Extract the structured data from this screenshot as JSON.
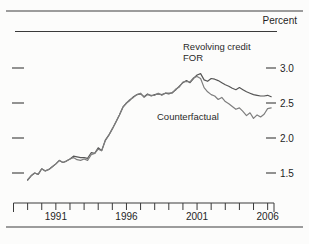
{
  "header": {
    "unit_label": "Percent"
  },
  "annotations": {
    "revolving_line1": "Revolving credit",
    "revolving_line2": "FOR",
    "counterfactual": "Counterfactual"
  },
  "colors": {
    "series_for": "#565656",
    "series_counterfactual": "#7e7e7e",
    "axis": "#3a3a3a",
    "rule_gray": "#9c9c9c",
    "text": "#1f1f1f"
  },
  "chart_data": {
    "type": "line",
    "title": "",
    "ylabel": "Percent",
    "grid": false,
    "legend_position": "inline-annotations",
    "x_axis": {
      "start": 1988,
      "end": 2006.45,
      "tick_interval": 1,
      "labeled_years": [
        1991,
        1996,
        2001,
        2006
      ],
      "labels": [
        "1991",
        "1996",
        "2001",
        "2006"
      ]
    },
    "y_axis": {
      "tick_values": [
        3.0,
        2.5,
        2.0,
        1.5
      ],
      "tick_labels": [
        "3.0",
        "2.5",
        "2.0",
        "1.5"
      ],
      "side": "right",
      "units": "Percent"
    },
    "series": [
      {
        "name": "Revolving credit FOR",
        "points": [
          [
            1989.0,
            1.4
          ],
          [
            1989.25,
            1.46
          ],
          [
            1989.5,
            1.5
          ],
          [
            1989.75,
            1.48
          ],
          [
            1990.0,
            1.56
          ],
          [
            1990.25,
            1.53
          ],
          [
            1990.5,
            1.55
          ],
          [
            1990.75,
            1.59
          ],
          [
            1991.0,
            1.63
          ],
          [
            1991.25,
            1.68
          ],
          [
            1991.5,
            1.65
          ],
          [
            1991.75,
            1.67
          ],
          [
            1992.0,
            1.7
          ],
          [
            1992.25,
            1.74
          ],
          [
            1992.5,
            1.73
          ],
          [
            1992.75,
            1.72
          ],
          [
            1993.0,
            1.72
          ],
          [
            1993.25,
            1.71
          ],
          [
            1993.5,
            1.79
          ],
          [
            1993.75,
            1.78
          ],
          [
            1994.0,
            1.86
          ],
          [
            1994.25,
            1.82
          ],
          [
            1994.5,
            1.97
          ],
          [
            1994.75,
            2.04
          ],
          [
            1995.0,
            2.13
          ],
          [
            1995.25,
            2.23
          ],
          [
            1995.5,
            2.33
          ],
          [
            1995.75,
            2.44
          ],
          [
            1996.0,
            2.5
          ],
          [
            1996.25,
            2.54
          ],
          [
            1996.5,
            2.59
          ],
          [
            1996.75,
            2.62
          ],
          [
            1997.0,
            2.63
          ],
          [
            1997.25,
            2.59
          ],
          [
            1997.5,
            2.63
          ],
          [
            1997.75,
            2.6
          ],
          [
            1998.0,
            2.62
          ],
          [
            1998.25,
            2.63
          ],
          [
            1998.5,
            2.62
          ],
          [
            1998.75,
            2.64
          ],
          [
            1999.0,
            2.63
          ],
          [
            1999.25,
            2.65
          ],
          [
            1999.5,
            2.69
          ],
          [
            1999.75,
            2.74
          ],
          [
            2000.0,
            2.79
          ],
          [
            2000.25,
            2.82
          ],
          [
            2000.5,
            2.79
          ],
          [
            2000.75,
            2.85
          ],
          [
            2001.0,
            2.9
          ],
          [
            2001.25,
            2.92
          ],
          [
            2001.5,
            2.83
          ],
          [
            2001.75,
            2.81
          ],
          [
            2002.0,
            2.85
          ],
          [
            2002.25,
            2.84
          ],
          [
            2002.5,
            2.82
          ],
          [
            2002.75,
            2.79
          ],
          [
            2003.0,
            2.76
          ],
          [
            2003.25,
            2.74
          ],
          [
            2003.5,
            2.71
          ],
          [
            2003.75,
            2.69
          ],
          [
            2004.0,
            2.72
          ],
          [
            2004.25,
            2.69
          ],
          [
            2004.5,
            2.66
          ],
          [
            2004.75,
            2.64
          ],
          [
            2005.0,
            2.62
          ],
          [
            2005.25,
            2.61
          ],
          [
            2005.5,
            2.6
          ],
          [
            2005.75,
            2.6
          ],
          [
            2006.0,
            2.61
          ],
          [
            2006.25,
            2.59
          ]
        ]
      },
      {
        "name": "Counterfactual",
        "points": [
          [
            1989.0,
            1.4
          ],
          [
            1989.25,
            1.46
          ],
          [
            1989.5,
            1.5
          ],
          [
            1989.75,
            1.48
          ],
          [
            1990.0,
            1.56
          ],
          [
            1990.25,
            1.53
          ],
          [
            1990.5,
            1.55
          ],
          [
            1990.75,
            1.59
          ],
          [
            1991.0,
            1.63
          ],
          [
            1991.25,
            1.68
          ],
          [
            1991.5,
            1.65
          ],
          [
            1991.75,
            1.67
          ],
          [
            1992.0,
            1.7
          ],
          [
            1992.25,
            1.72
          ],
          [
            1992.5,
            1.69
          ],
          [
            1992.75,
            1.68
          ],
          [
            1993.0,
            1.7
          ],
          [
            1993.25,
            1.68
          ],
          [
            1993.5,
            1.76
          ],
          [
            1993.75,
            1.78
          ],
          [
            1994.0,
            1.84
          ],
          [
            1994.25,
            1.82
          ],
          [
            1994.5,
            1.96
          ],
          [
            1994.75,
            2.04
          ],
          [
            1995.0,
            2.13
          ],
          [
            1995.25,
            2.23
          ],
          [
            1995.5,
            2.33
          ],
          [
            1995.75,
            2.44
          ],
          [
            1996.0,
            2.5
          ],
          [
            1996.25,
            2.55
          ],
          [
            1996.5,
            2.58
          ],
          [
            1996.75,
            2.62
          ],
          [
            1997.0,
            2.64
          ],
          [
            1997.25,
            2.58
          ],
          [
            1997.5,
            2.62
          ],
          [
            1997.75,
            2.61
          ],
          [
            1998.0,
            2.61
          ],
          [
            1998.25,
            2.64
          ],
          [
            1998.5,
            2.61
          ],
          [
            1998.75,
            2.64
          ],
          [
            1999.0,
            2.64
          ],
          [
            1999.25,
            2.64
          ],
          [
            1999.5,
            2.7
          ],
          [
            1999.75,
            2.73
          ],
          [
            2000.0,
            2.8
          ],
          [
            2000.25,
            2.81
          ],
          [
            2000.5,
            2.8
          ],
          [
            2000.75,
            2.86
          ],
          [
            2001.0,
            2.88
          ],
          [
            2001.25,
            2.85
          ],
          [
            2001.5,
            2.72
          ],
          [
            2001.75,
            2.66
          ],
          [
            2002.0,
            2.62
          ],
          [
            2002.25,
            2.6
          ],
          [
            2002.5,
            2.55
          ],
          [
            2002.75,
            2.58
          ],
          [
            2003.0,
            2.52
          ],
          [
            2003.25,
            2.49
          ],
          [
            2003.5,
            2.45
          ],
          [
            2003.75,
            2.41
          ],
          [
            2004.0,
            2.43
          ],
          [
            2004.25,
            2.38
          ],
          [
            2004.5,
            2.32
          ],
          [
            2004.75,
            2.36
          ],
          [
            2005.0,
            2.28
          ],
          [
            2005.25,
            2.33
          ],
          [
            2005.5,
            2.3
          ],
          [
            2005.75,
            2.34
          ],
          [
            2006.0,
            2.42
          ],
          [
            2006.25,
            2.43
          ]
        ]
      }
    ]
  }
}
